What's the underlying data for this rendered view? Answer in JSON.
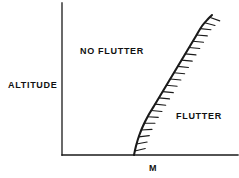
{
  "figure": {
    "name": "flutter-boundary-diagram",
    "background_color": "#ffffff",
    "line_color": "#1a1a1a"
  },
  "axes": {
    "y_axis_label": "ALTITUDE",
    "x_axis_label": "M",
    "origin": {
      "x": 62,
      "y": 155
    },
    "y_axis_top": {
      "x": 62,
      "y": 3
    },
    "x_axis_right": {
      "x": 238,
      "y": 155
    }
  },
  "regions": [
    {
      "id": "no-flutter",
      "label": "NO FLUTTER",
      "position": {
        "x": 80,
        "y": 46
      }
    },
    {
      "id": "flutter",
      "label": "FLUTTER",
      "position": {
        "x": 176,
        "y": 111
      }
    }
  ],
  "chart_data": {
    "type": "line",
    "title": "",
    "xlabel": "M",
    "ylabel": "ALTITUDE",
    "grid": false,
    "legend": null,
    "annotations": [
      "NO FLUTTER",
      "FLUTTER"
    ],
    "series": [
      {
        "name": "flutter boundary",
        "style": "hatched-boundary",
        "hatch_side": "flutter",
        "hatch_count": 22,
        "hatch_length": 11,
        "points": [
          [
            134,
            155
          ],
          [
            136,
            146
          ],
          [
            139,
            136
          ],
          [
            143,
            126
          ],
          [
            148,
            116
          ],
          [
            154,
            106
          ],
          [
            160,
            96
          ],
          [
            166,
            86
          ],
          [
            172,
            76
          ],
          [
            178,
            66
          ],
          [
            184,
            56
          ],
          [
            190,
            46
          ],
          [
            196,
            36
          ],
          [
            202,
            26
          ],
          [
            208,
            19
          ],
          [
            212,
            15
          ]
        ]
      }
    ]
  }
}
